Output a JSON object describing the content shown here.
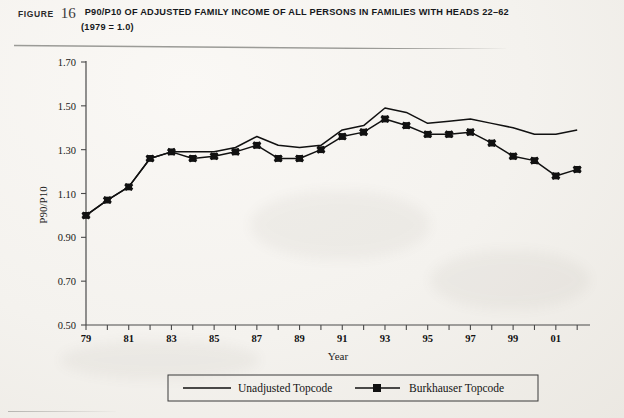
{
  "header": {
    "figure_word": "FIGURE",
    "figure_number": "16",
    "title": "P90/P10 OF ADJUSTED FAMILY INCOME OF ALL PERSONS IN FAMILIES WITH HEADS 22–62",
    "subtitle": "(1979 = 1.0)"
  },
  "legend": {
    "items": [
      {
        "label": "Unadjusted Topcode",
        "marker": "none",
        "color": "#111111"
      },
      {
        "label": "Burkhauser Topcode",
        "marker": "square",
        "color": "#111111"
      }
    ]
  },
  "chart_data": {
    "type": "line",
    "title": "P90/P10 OF ADJUSTED FAMILY INCOME OF ALL PERSONS IN FAMILIES WITH HEADS 22–62",
    "subtitle": "(1979 = 1.0)",
    "xlabel": "Year",
    "ylabel": "P90/P10",
    "grid": false,
    "legend_position": "bottom",
    "ylim": [
      0.5,
      1.7
    ],
    "ytick_values": [
      0.5,
      0.7,
      0.9,
      1.1,
      1.3,
      1.5,
      1.7
    ],
    "ytick_labels": [
      "0.50",
      "0.70",
      "0.90",
      "1.10",
      "1.30",
      "1.50",
      "1.70"
    ],
    "x": [
      1979,
      1980,
      1981,
      1982,
      1983,
      1984,
      1985,
      1986,
      1987,
      1988,
      1989,
      1990,
      1991,
      1992,
      1993,
      1994,
      1995,
      1996,
      1997,
      1998,
      1999,
      2000,
      2001,
      2002
    ],
    "xtick_labels": [
      "79",
      "",
      "81",
      "",
      "83",
      "",
      "85",
      "",
      "87",
      "",
      "89",
      "",
      "91",
      "",
      "93",
      "",
      "95",
      "",
      "97",
      "",
      "99",
      "",
      "01",
      ""
    ],
    "xlim": [
      1979,
      2002.6
    ],
    "series": [
      {
        "name": "Unadjusted Topcode",
        "marker": "none",
        "values": [
          1.0,
          1.07,
          1.13,
          1.26,
          1.29,
          1.29,
          1.29,
          1.31,
          1.36,
          1.32,
          1.31,
          1.32,
          1.39,
          1.41,
          1.49,
          1.47,
          1.42,
          1.43,
          1.44,
          1.42,
          1.4,
          1.37,
          1.37,
          1.39
        ]
      },
      {
        "name": "Burkhauser Topcode",
        "marker": "square",
        "values": [
          1.0,
          1.07,
          1.13,
          1.26,
          1.29,
          1.26,
          1.27,
          1.29,
          1.32,
          1.26,
          1.26,
          1.3,
          1.36,
          1.38,
          1.44,
          1.41,
          1.37,
          1.37,
          1.38,
          1.33,
          1.27,
          1.25,
          1.18,
          1.21
        ]
      }
    ]
  },
  "colors": {
    "ink": "#111111",
    "axis": "#555555",
    "paper": "#f4f2ee"
  }
}
